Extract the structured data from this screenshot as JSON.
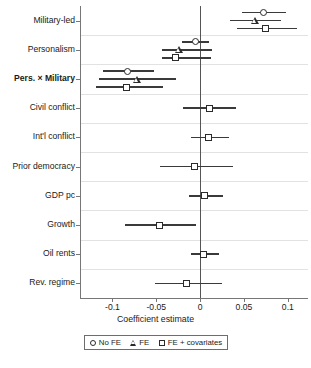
{
  "chart_data": {
    "type": "scatter",
    "title": "",
    "xlabel": "Coefficient estimate",
    "ylabel": "",
    "xlim": [
      -0.137,
      0.123
    ],
    "ylim": [
      0,
      10
    ],
    "grid": "horizontal-light",
    "orientation": "horizontal",
    "plot_style": "coefficient-plot",
    "zero_reference_line": 0,
    "xticks": [
      -0.1,
      -0.05,
      0,
      0.05,
      0.1
    ],
    "xticklabels": [
      "-0.1",
      "-0.05",
      "0",
      "0.05",
      "0.1"
    ],
    "categories": [
      "Military-led",
      "Personalism",
      "Pers. × Military",
      "Civil conflict",
      "Int'l conflict",
      "Prior democracy",
      "GDP pc",
      "Growth",
      "Oil rents",
      "Rev. regime"
    ],
    "bold_categories": [
      "Pers. × Military"
    ],
    "legend": {
      "position": "bottom",
      "entries": [
        {
          "label": "No FE",
          "marker": "circle"
        },
        {
          "label": "FE",
          "marker": "triangle"
        },
        {
          "label": "FE + covariates",
          "marker": "square"
        }
      ]
    },
    "series": [
      {
        "name": "No FE",
        "marker": "circle",
        "points": [
          {
            "category": "Military-led",
            "estimate": 0.072,
            "ci_low": 0.048,
            "ci_high": 0.098
          },
          {
            "category": "Personalism",
            "estimate": -0.005,
            "ci_low": -0.021,
            "ci_high": 0.01
          },
          {
            "category": "Pers. × Military",
            "estimate": -0.083,
            "ci_low": -0.111,
            "ci_high": -0.053
          }
        ]
      },
      {
        "name": "FE",
        "marker": "triangle",
        "points": [
          {
            "category": "Military-led",
            "estimate": 0.062,
            "ci_low": 0.034,
            "ci_high": 0.092
          },
          {
            "category": "Personalism",
            "estimate": -0.024,
            "ci_low": -0.043,
            "ci_high": 0.013
          },
          {
            "category": "Pers. × Military",
            "estimate": -0.072,
            "ci_low": -0.115,
            "ci_high": -0.028
          }
        ]
      },
      {
        "name": "FE + covariates",
        "marker": "square",
        "points": [
          {
            "category": "Military-led",
            "estimate": 0.074,
            "ci_low": 0.042,
            "ci_high": 0.11
          },
          {
            "category": "Personalism",
            "estimate": -0.028,
            "ci_low": -0.044,
            "ci_high": 0.012
          },
          {
            "category": "Pers. × Military",
            "estimate": -0.084,
            "ci_low": -0.119,
            "ci_high": -0.042
          },
          {
            "category": "Civil conflict",
            "estimate": 0.011,
            "ci_low": -0.019,
            "ci_high": 0.041
          },
          {
            "category": "Int'l conflict",
            "estimate": 0.009,
            "ci_low": -0.01,
            "ci_high": 0.033
          },
          {
            "category": "Prior democracy",
            "estimate": -0.007,
            "ci_low": -0.046,
            "ci_high": 0.037
          },
          {
            "category": "GDP pc",
            "estimate": 0.005,
            "ci_low": -0.013,
            "ci_high": 0.026
          },
          {
            "category": "Growth",
            "estimate": -0.046,
            "ci_low": -0.086,
            "ci_high": -0.005
          },
          {
            "category": "Oil rents",
            "estimate": 0.004,
            "ci_low": -0.01,
            "ci_high": 0.021
          },
          {
            "category": "Rev. regime",
            "estimate": -0.015,
            "ci_low": -0.052,
            "ci_high": 0.025
          }
        ]
      }
    ]
  },
  "axis": {
    "x_title": "Coefficient estimate"
  },
  "caption": {
    "sliver": ""
  },
  "colors": {
    "marker_edge": "#2b2b2b",
    "ci_bar": "#3a3a3a",
    "gridline": "#e2e2e2",
    "axis": "#777777",
    "zero_line": "#555555",
    "text": "#1a1a1a"
  }
}
